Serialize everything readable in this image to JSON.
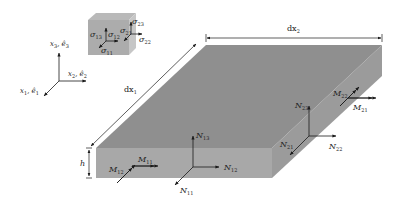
{
  "diagram": {
    "type": "plate-element-stress-resultants",
    "colors": {
      "top_face": "#8f8f8f",
      "front_face": "#a6a6a6",
      "side_face": "#9a9a9a",
      "cube_top": "#b5b5b5",
      "cube_front": "#a9a9a9",
      "cube_side": "#c4c4c4",
      "line": "#1a1a1a"
    },
    "axes": {
      "x3": {
        "base": "x",
        "sub": "3",
        "vec": "ê",
        "vec_sub": "3"
      },
      "x2": {
        "base": "x",
        "sub": "2",
        "vec": "ê",
        "vec_sub": "2"
      },
      "x1": {
        "base": "x",
        "sub": "1",
        "vec": "ê",
        "vec_sub": "1"
      }
    },
    "dimensions": {
      "dx1": {
        "base": "dx",
        "sub": "1"
      },
      "dx2": {
        "base": "dx",
        "sub": "2"
      },
      "h": "h"
    },
    "stresses": [
      {
        "id": "sigma13",
        "base": "σ",
        "sub": "13"
      },
      {
        "id": "sigma12",
        "base": "σ",
        "sub": "12"
      },
      {
        "id": "sigma11",
        "base": "σ",
        "sub": "11"
      },
      {
        "id": "sigma21",
        "base": "σ",
        "sub": "21"
      },
      {
        "id": "sigma23",
        "base": "σ",
        "sub": "23"
      },
      {
        "id": "sigma22",
        "base": "σ",
        "sub": "22"
      }
    ],
    "resultants": [
      {
        "id": "N13",
        "base": "N",
        "sub": "13"
      },
      {
        "id": "N12",
        "base": "N",
        "sub": "12"
      },
      {
        "id": "N11",
        "base": "N",
        "sub": "11"
      },
      {
        "id": "M11",
        "base": "M",
        "sub": "11"
      },
      {
        "id": "M12",
        "base": "M",
        "sub": "12"
      },
      {
        "id": "N23",
        "base": "N",
        "sub": "23"
      },
      {
        "id": "N21",
        "base": "N",
        "sub": "21"
      },
      {
        "id": "N22",
        "base": "N",
        "sub": "22"
      },
      {
        "id": "M22",
        "base": "M",
        "sub": "22"
      },
      {
        "id": "M21",
        "base": "M",
        "sub": "21"
      }
    ]
  }
}
